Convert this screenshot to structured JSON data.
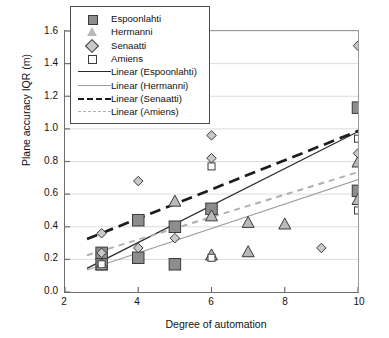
{
  "chart_data": {
    "type": "scatter",
    "title": "",
    "xlabel": "Degree of automation",
    "ylabel": "Plane accuracy IQR (m)",
    "xlim": [
      2,
      10
    ],
    "ylim": [
      0.0,
      1.6
    ],
    "xticks": [
      "2",
      "4",
      "6",
      "8",
      "10"
    ],
    "yticks": [
      "0.0",
      "0.2",
      "0.4",
      "0.6",
      "0.8",
      "1.0",
      "1.2",
      "1.4",
      "1.6"
    ],
    "grid": "horizontal",
    "legend_position": "top-left-inside",
    "series": [
      {
        "name": "Espoonlahti",
        "marker": "filled-square",
        "color": "#8d8d8d",
        "points": [
          [
            3,
            0.24
          ],
          [
            3,
            0.17
          ],
          [
            4,
            0.44
          ],
          [
            4,
            0.21
          ],
          [
            5,
            0.4
          ],
          [
            5,
            0.17
          ],
          [
            6,
            0.51
          ],
          [
            10,
            1.13
          ],
          [
            10,
            0.62
          ]
        ]
      },
      {
        "name": "Hermanni",
        "marker": "filled-triangle",
        "color": "#b9b9b9",
        "points": [
          [
            3,
            0.17
          ],
          [
            5,
            0.56
          ],
          [
            6,
            0.47
          ],
          [
            6,
            0.23
          ],
          [
            7,
            0.43
          ],
          [
            7,
            0.25
          ],
          [
            8,
            0.42
          ],
          [
            10,
            0.8
          ],
          [
            10,
            0.57
          ]
        ]
      },
      {
        "name": "Senaatti",
        "marker": "filled-diamond",
        "color": "#c9c9c9",
        "points": [
          [
            3,
            0.36
          ],
          [
            3,
            0.24
          ],
          [
            4,
            0.68
          ],
          [
            4,
            0.27
          ],
          [
            5,
            0.33
          ],
          [
            6,
            0.96
          ],
          [
            6,
            0.82
          ],
          [
            9,
            0.27
          ],
          [
            10,
            1.51
          ],
          [
            10,
            0.85
          ]
        ]
      },
      {
        "name": "Amiens",
        "marker": "open-square",
        "color": "#ffffff",
        "points": [
          [
            3,
            0.17
          ],
          [
            6,
            0.77
          ],
          [
            6,
            0.21
          ],
          [
            10,
            0.94
          ],
          [
            10,
            0.5
          ]
        ]
      }
    ],
    "trendlines": [
      {
        "name": "Linear (Espoonlahti)",
        "style": "solid-thin-dark",
        "x": [
          2.6,
          10.15
        ],
        "y": [
          0.145,
          1.0
        ]
      },
      {
        "name": "Linear (Hermanni)",
        "style": "solid-thin-light",
        "x": [
          2.6,
          10.15
        ],
        "y": [
          0.135,
          0.7
        ]
      },
      {
        "name": "Linear (Senaatti)",
        "style": "dashed-thick-dark",
        "x": [
          2.6,
          10.15
        ],
        "y": [
          0.325,
          1.0
        ]
      },
      {
        "name": "Linear (Amiens)",
        "style": "dashed-thin-gray",
        "x": [
          2.6,
          10.15
        ],
        "y": [
          0.225,
          0.745
        ]
      }
    ]
  },
  "legend": {
    "entries": [
      {
        "label": "Espoonlahti"
      },
      {
        "label": "Hermanni"
      },
      {
        "label": "Senaatti"
      },
      {
        "label": "Amiens"
      },
      {
        "label": "Linear (Espoonlahti)"
      },
      {
        "label": "Linear (Hermanni)"
      },
      {
        "label": "Linear (Senaatti)"
      },
      {
        "label": "Linear (Amiens)"
      }
    ]
  },
  "axes": {
    "y_label": "Plane accuracy IQR (m)",
    "x_label": "Degree of automation",
    "y_ticks": [
      "1.6",
      "1.4",
      "1.2",
      "1.0",
      "0.8",
      "0.6",
      "0.4",
      "0.2",
      "0.0"
    ],
    "x_ticks": [
      "2",
      "4",
      "6",
      "8",
      "10"
    ]
  },
  "colors": {
    "frame": "#6f6f6f",
    "grid": "#dcdcdc",
    "espoonlahti": "#8d8d8d",
    "hermanni": "#b9b9b9",
    "senaatti": "#c9c9c9",
    "amiens": "#ffffff",
    "marker_edge": "#3a3a3a"
  }
}
